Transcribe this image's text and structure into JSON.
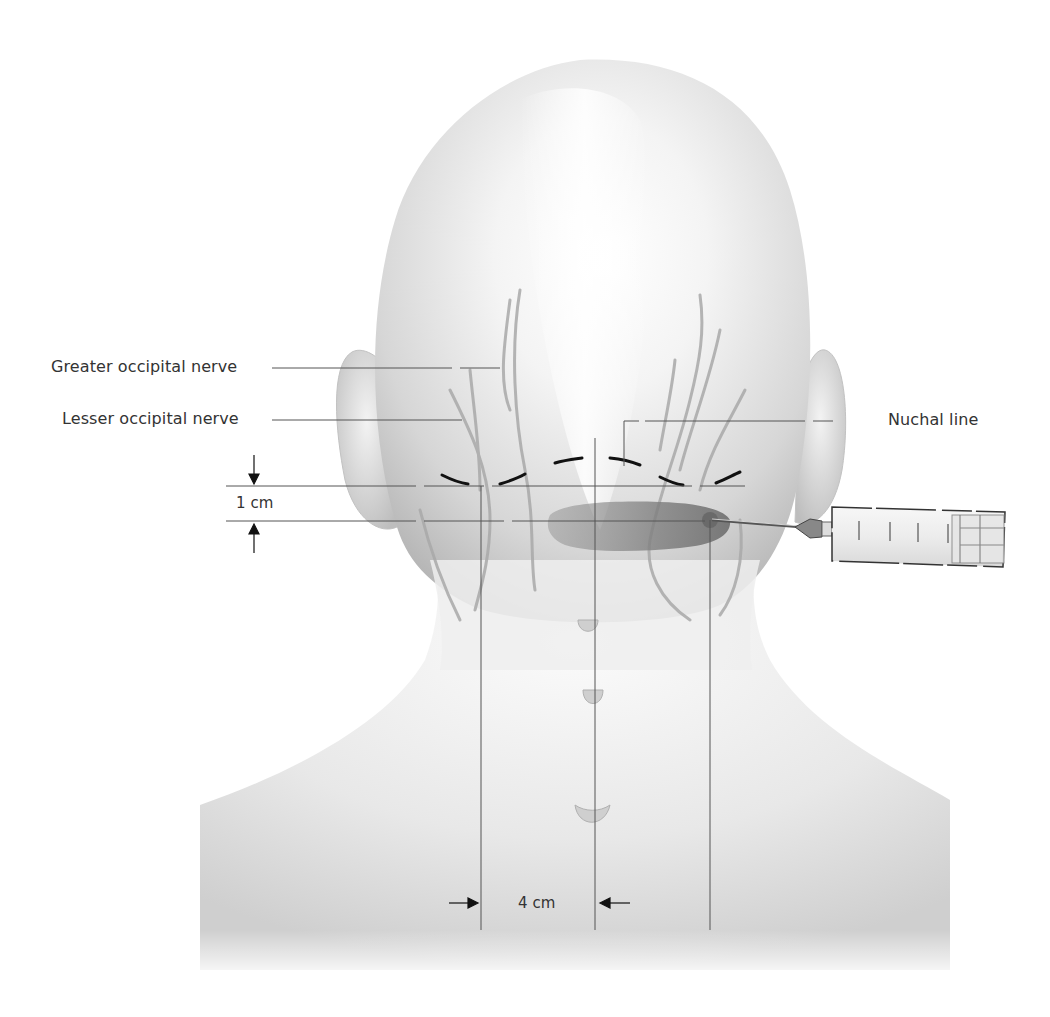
{
  "figure": {
    "labels": {
      "greater_occipital_nerve": "Greater occipital nerve",
      "lesser_occipital_nerve": "Lesser occipital nerve",
      "nuchal_line": "Nuchal line"
    },
    "dimensions": {
      "vertical": "1 cm",
      "horizontal": "4 cm"
    },
    "syringe": {
      "scale_marks": [
        "1",
        "2",
        "3",
        "4",
        "5"
      ]
    },
    "colors": {
      "skin": "#e6e6e6",
      "skin_shadow": "#b8b8b8",
      "nerve": "#a8a8a8",
      "line": "#555555",
      "nuchal_dash": "#111111",
      "injection_zone": "#8a8a8a",
      "label_text": "#333333"
    }
  }
}
